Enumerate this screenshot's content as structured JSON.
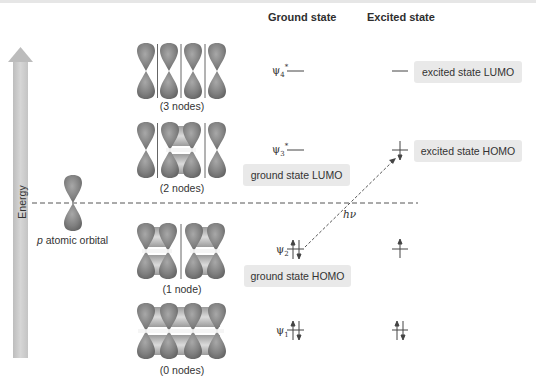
{
  "headers": {
    "ground": "Ground state",
    "excited": "Excited state"
  },
  "energy_axis": {
    "label": "Energy"
  },
  "atomic_orbital": {
    "label_italic": "p",
    "label_rest": " atomic orbital"
  },
  "molecular_orbitals": [
    {
      "id": "psi4",
      "name": "ψ4*",
      "symbol": "ψ",
      "sub": "4",
      "sup": "*",
      "nodes_label": "(3 nodes)",
      "ground_electrons": "none",
      "excited_electrons": "none"
    },
    {
      "id": "psi3",
      "name": "ψ3*",
      "symbol": "ψ",
      "sub": "3",
      "sup": "*",
      "nodes_label": "(2 nodes)",
      "ground_electrons": "none",
      "excited_electrons": "down"
    },
    {
      "id": "psi2",
      "name": "ψ2",
      "symbol": "ψ",
      "sub": "2",
      "sup": "",
      "nodes_label": "(1 node)",
      "ground_electrons": "up-down",
      "excited_electrons": "up"
    },
    {
      "id": "psi1",
      "name": "ψ1",
      "symbol": "ψ",
      "sub": "1",
      "sup": "",
      "nodes_label": "(0 nodes)",
      "ground_electrons": "up-down",
      "excited_electrons": "up-down"
    }
  ],
  "callouts": {
    "excited_lumo": "excited state LUMO",
    "excited_homo": "excited state HOMO",
    "ground_lumo": "ground state LUMO",
    "ground_homo": "ground state HOMO"
  },
  "transition": {
    "label": "hν"
  },
  "colors": {
    "orbital": "#8a8a8a",
    "orbital_dark": "#6e6e6e",
    "arrow_fill": "#c9c9c9",
    "callout_bg": "#e9e9e9",
    "line": "#555555"
  }
}
